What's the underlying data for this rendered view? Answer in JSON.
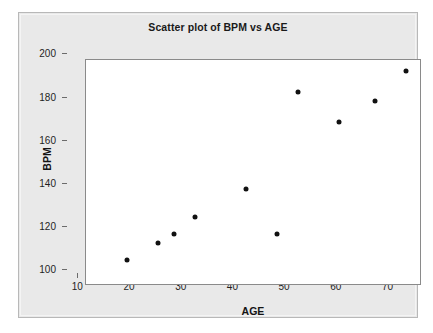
{
  "chart_data": {
    "type": "scatter",
    "title": "Scatter plot of BPM vs AGE",
    "xlabel": "AGE",
    "ylabel": "BPM",
    "xlim": [
      8,
      73
    ],
    "ylim": [
      98,
      203
    ],
    "xticks": [
      10,
      20,
      30,
      40,
      50,
      60,
      70
    ],
    "yticks": [
      100,
      120,
      140,
      160,
      180,
      200
    ],
    "grid": false,
    "legend": null,
    "marker": "filled-circle",
    "marker_color": "#111111",
    "points": [
      {
        "x": 16,
        "y": 110
      },
      {
        "x": 22,
        "y": 118
      },
      {
        "x": 25,
        "y": 122
      },
      {
        "x": 29,
        "y": 130
      },
      {
        "x": 39,
        "y": 143
      },
      {
        "x": 45,
        "y": 122
      },
      {
        "x": 49,
        "y": 188
      },
      {
        "x": 57,
        "y": 174
      },
      {
        "x": 64,
        "y": 184
      },
      {
        "x": 70,
        "y": 198
      }
    ],
    "x": [
      16,
      22,
      25,
      29,
      39,
      45,
      49,
      57,
      64,
      70
    ],
    "values": [
      110,
      118,
      122,
      130,
      143,
      122,
      188,
      174,
      184,
      198
    ]
  },
  "style": {
    "panel_background": "#e9e9e9",
    "plot_background": "#ffffff",
    "frame_color": "#8a8a8a",
    "text_color": "#1f1f1f",
    "page_background": "#ffffff"
  }
}
